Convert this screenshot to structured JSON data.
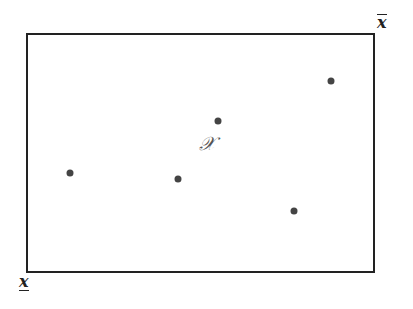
{
  "diagram": {
    "set_label": "𝒳",
    "upper_bound_label": "x",
    "lower_bound_label": "x",
    "colors": {
      "border": "#222222",
      "points": "#444444"
    },
    "points": [
      {
        "x": 70,
        "y": 173
      },
      {
        "x": 178,
        "y": 179
      },
      {
        "x": 218,
        "y": 121
      },
      {
        "x": 331,
        "y": 81
      },
      {
        "x": 294,
        "y": 211
      }
    ]
  }
}
